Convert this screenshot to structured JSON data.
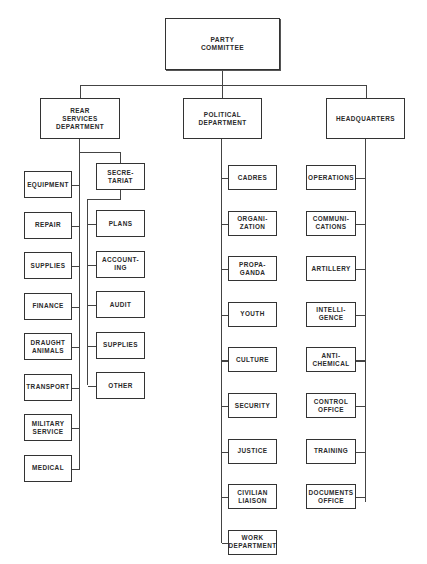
{
  "chart_data": {
    "type": "org_chart",
    "root": "PARTY COMMITTEE",
    "departments": [
      {
        "name": "REAR SERVICES DEPARTMENT",
        "units": [
          "EQUIPMENT",
          "REPAIR",
          "SUPPLIES",
          "FINANCE",
          "DRAUGHT ANIMALS",
          "TRANSPORT",
          "MILITARY SERVICE",
          "MEDICAL"
        ],
        "sub_branch": {
          "name": "SECRETARIAT",
          "units": [
            "PLANS",
            "ACCOUNTING",
            "AUDIT",
            "SUPPLIES",
            "OTHER"
          ]
        }
      },
      {
        "name": "POLITICAL DEPARTMENT",
        "units": [
          "CADRES",
          "ORGANIZATION",
          "PROPAGANDA",
          "YOUTH",
          "CULTURE",
          "SECURITY",
          "JUSTICE",
          "CIVILIAN LIAISON",
          "WORK DEPARTMENT"
        ]
      },
      {
        "name": "HEADQUARTERS",
        "units": [
          "OPERATIONS",
          "COMMUNICATIONS",
          "ARTILLERY",
          "INTELLIGENCE",
          "ANTI-CHEMICAL",
          "CONTROL OFFICE",
          "TRAINING",
          "DOCUMENTS OFFICE"
        ]
      }
    ]
  },
  "root": {
    "label": "PARTY\nCOMMITTEE"
  },
  "rear": {
    "label": "REAR\nSERVICES\nDEPARTMENT",
    "units": [
      "EQUIPMENT",
      "REPAIR",
      "SUPPLIES",
      "FINANCE",
      "DRAUGHT\nANIMALS",
      "TRANSPORT",
      "MILITARY\nSERVICE",
      "MEDICAL"
    ],
    "secretariat": {
      "label": "SECRE-\nTARIAT",
      "units": [
        "PLANS",
        "ACCOUNT-\nING",
        "AUDIT",
        "SUPPLIES",
        "OTHER"
      ]
    }
  },
  "political": {
    "label": "POLITICAL\nDEPARTMENT",
    "units": [
      "CADRES",
      "ORGANI-\nZATION",
      "PROPA-\nGANDA",
      "YOUTH",
      "CULTURE",
      "SECURITY",
      "JUSTICE",
      "CIVILIAN\nLIAISON",
      "WORK\nDEPARTMENT"
    ]
  },
  "hq": {
    "label": "HEADQUARTERS",
    "units": [
      "OPERATIONS",
      "COMMUNI-\nCATIONS",
      "ARTILLERY",
      "INTELLI-\nGENCE",
      "ANTI-\nCHEMICAL",
      "CONTROL\nOFFICE",
      "TRAINING",
      "DOCUMENTS\nOFFICE"
    ]
  }
}
